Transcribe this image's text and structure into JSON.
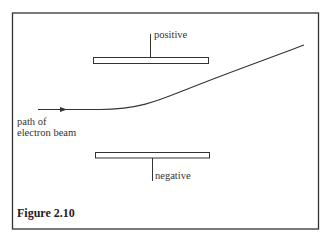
{
  "figure": {
    "caption": "Figure 2.10",
    "labels": {
      "positive_plate": "positive",
      "negative_plate": "negative",
      "beam_line1": "path of",
      "beam_line2": "electron beam"
    }
  }
}
